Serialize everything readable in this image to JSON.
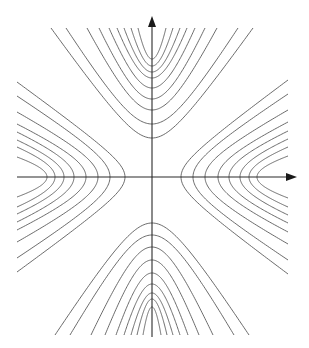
{
  "diagram": {
    "type": "contour-plot",
    "colors": {
      "background": "#ffffff",
      "curve": "#5a5a5a",
      "axis": "#2a2a2a",
      "arrowhead": "#1a1a1a"
    },
    "origin": {
      "x": 152,
      "y": 177
    },
    "axes": {
      "x_axis": {
        "x_start": 17,
        "x_end": 297,
        "y": 177,
        "arrow": "right"
      },
      "y_axis": {
        "y_start": 337,
        "y_end": 16,
        "x": 152,
        "arrow": "up"
      }
    },
    "clip": {
      "left": 17,
      "right": 289,
      "top": 28,
      "bottom": 335
    },
    "branches": {
      "top": {
        "orientation": "vertical-up",
        "edge_distance": 149,
        "curves": [
          {
            "vertex": 39,
            "half_width": 101
          },
          {
            "vertex": 53,
            "half_width": 86
          },
          {
            "vertex": 67,
            "half_width": 65
          },
          {
            "vertex": 78,
            "half_width": 53
          },
          {
            "vertex": 89,
            "half_width": 43
          },
          {
            "vertex": 99,
            "half_width": 35
          },
          {
            "vertex": 105,
            "half_width": 28
          },
          {
            "vertex": 111,
            "half_width": 21
          },
          {
            "vertex": 118,
            "half_width": 14
          }
        ]
      },
      "bottom": {
        "orientation": "vertical-down",
        "edge_distance": 158,
        "curves": [
          {
            "vertex": 46,
            "half_width": 97
          },
          {
            "vertex": 58,
            "half_width": 82
          },
          {
            "vertex": 70,
            "half_width": 61
          },
          {
            "vertex": 83,
            "half_width": 47
          },
          {
            "vertex": 96,
            "half_width": 36
          },
          {
            "vertex": 107,
            "half_width": 28
          },
          {
            "vertex": 116,
            "half_width": 21
          },
          {
            "vertex": 122,
            "half_width": 15
          },
          {
            "vertex": 130,
            "half_width": 9
          }
        ]
      },
      "left": {
        "orientation": "horizontal-left",
        "edge_distance": 135,
        "curves": [
          {
            "vertex": 27,
            "half_width": 95
          },
          {
            "vertex": 42,
            "half_width": 81
          },
          {
            "vertex": 54,
            "half_width": 65
          },
          {
            "vertex": 66,
            "half_width": 53
          },
          {
            "vertex": 78,
            "half_width": 45
          },
          {
            "vertex": 88,
            "half_width": 37
          },
          {
            "vertex": 97,
            "half_width": 30
          },
          {
            "vertex": 105,
            "half_width": 20
          }
        ]
      },
      "right": {
        "orientation": "horizontal-right",
        "edge_distance": 136,
        "curves": [
          {
            "vertex": 29,
            "half_width": 97
          },
          {
            "vertex": 41,
            "half_width": 83
          },
          {
            "vertex": 53,
            "half_width": 67
          },
          {
            "vertex": 66,
            "half_width": 55
          },
          {
            "vertex": 77,
            "half_width": 46
          },
          {
            "vertex": 88,
            "half_width": 38
          },
          {
            "vertex": 97,
            "half_width": 30
          },
          {
            "vertex": 105,
            "half_width": 21
          }
        ]
      }
    }
  }
}
